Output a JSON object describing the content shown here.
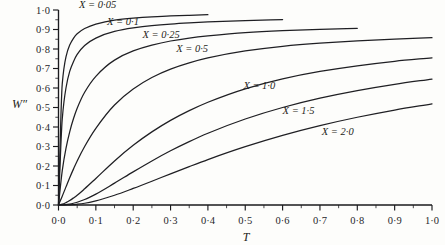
{
  "figure": {
    "background_color": "#fdfdfb",
    "ink_color": "#1f1f23"
  },
  "axes": {
    "y_title": "W″",
    "x_title": "T",
    "y_ticks": [
      "0·0",
      "0·1",
      "0·2",
      "0·3",
      "0·4",
      "0·5",
      "0·6",
      "0·7",
      "0·8",
      "0·9",
      "1·0"
    ],
    "x_ticks": [
      "0·0",
      "0·1",
      "0·2",
      "0·3",
      "0·4",
      "0·5",
      "0·6",
      "0·7",
      "0·8",
      "0·9",
      "1·0"
    ]
  },
  "curve_labels": [
    {
      "text": "X = 0·05"
    },
    {
      "text": "X = 0·1"
    },
    {
      "text": "X = 0·25"
    },
    {
      "text": "X = 0·5"
    },
    {
      "text": "X = 1·0"
    },
    {
      "text": "X = 1·5"
    },
    {
      "text": "X = 2·0"
    }
  ],
  "chart_data": {
    "type": "line",
    "title": "",
    "xlabel": "T",
    "ylabel": "W″",
    "xlim": [
      0.0,
      1.0
    ],
    "ylim": [
      0.0,
      1.0
    ],
    "grid": false,
    "legend": "inline-curve-labels",
    "x_tick_values": [
      0.0,
      0.1,
      0.2,
      0.3,
      0.4,
      0.5,
      0.6,
      0.7,
      0.8,
      0.9,
      1.0
    ],
    "y_tick_values": [
      0.0,
      0.1,
      0.2,
      0.3,
      0.4,
      0.5,
      0.6,
      0.7,
      0.8,
      0.9,
      1.0
    ],
    "x_tick_labels": [
      "0·0",
      "0·1",
      "0·2",
      "0·3",
      "0·4",
      "0·5",
      "0·6",
      "0·7",
      "0·8",
      "0·9",
      "1·0"
    ],
    "y_tick_labels": [
      "0·0",
      "0·1",
      "0·2",
      "0·3",
      "0·4",
      "0·5",
      "0·6",
      "0·7",
      "0·8",
      "0·9",
      "1·0"
    ],
    "x": [
      0.0,
      0.01,
      0.02,
      0.03,
      0.04,
      0.05,
      0.07,
      0.1,
      0.15,
      0.2,
      0.25,
      0.3,
      0.35,
      0.4,
      0.5,
      0.6,
      0.7,
      0.8,
      0.9,
      1.0
    ],
    "series": [
      {
        "name": "X = 0·05",
        "parameter": 0.05,
        "label_position": {
          "x": 0.055,
          "y": 1.01
        },
        "x_end": 0.45,
        "values": [
          0.0,
          0.62,
          0.76,
          0.82,
          0.855,
          0.878,
          0.905,
          0.928,
          0.948,
          0.958,
          0.965,
          0.97,
          0.973,
          0.976,
          null,
          null,
          null,
          null,
          null,
          null
        ]
      },
      {
        "name": "X = 0·1",
        "parameter": 0.1,
        "label_position": {
          "x": 0.13,
          "y": 0.925
        },
        "x_end": 0.66,
        "values": [
          0.0,
          0.44,
          0.6,
          0.685,
          0.735,
          0.772,
          0.818,
          0.856,
          0.89,
          0.908,
          0.92,
          0.928,
          0.934,
          0.939,
          0.946,
          0.951,
          0.954,
          null,
          null,
          null
        ]
      },
      {
        "name": "X = 0·25",
        "parameter": 0.25,
        "label_position": {
          "x": 0.225,
          "y": 0.855
        },
        "x_end": 0.8,
        "values": [
          0.0,
          0.175,
          0.29,
          0.375,
          0.442,
          0.496,
          0.578,
          0.66,
          0.743,
          0.79,
          0.82,
          0.841,
          0.856,
          0.867,
          0.884,
          0.894,
          0.901,
          0.906,
          null,
          null
        ]
      },
      {
        "name": "X = 0·5",
        "parameter": 0.5,
        "label_position": {
          "x": 0.315,
          "y": 0.785
        },
        "x_end": 1.0,
        "values": [
          0.0,
          0.045,
          0.093,
          0.14,
          0.184,
          0.226,
          0.3,
          0.393,
          0.513,
          0.595,
          0.654,
          0.697,
          0.729,
          0.754,
          0.79,
          0.814,
          0.83,
          0.842,
          0.851,
          0.858
        ]
      },
      {
        "name": "X = 1·0",
        "parameter": 1.0,
        "label_position": {
          "x": 0.495,
          "y": 0.595
        },
        "x_end": 1.0,
        "values": [
          0.0,
          0.004,
          0.012,
          0.023,
          0.036,
          0.05,
          0.083,
          0.136,
          0.226,
          0.306,
          0.375,
          0.434,
          0.484,
          0.527,
          0.596,
          0.647,
          0.685,
          0.714,
          0.737,
          0.755
        ]
      },
      {
        "name": "X = 1·5",
        "parameter": 1.5,
        "label_position": {
          "x": 0.6,
          "y": 0.465
        },
        "x_end": 1.0,
        "values": [
          0.0,
          0.0005,
          0.002,
          0.005,
          0.009,
          0.014,
          0.028,
          0.056,
          0.112,
          0.17,
          0.226,
          0.278,
          0.325,
          0.368,
          0.441,
          0.5,
          0.548,
          0.587,
          0.619,
          0.646
        ]
      },
      {
        "name": "X = 2·0",
        "parameter": 2.0,
        "label_position": {
          "x": 0.705,
          "y": 0.36
        },
        "x_end": 1.0,
        "values": [
          0.0,
          0.0001,
          0.0004,
          0.001,
          0.002,
          0.004,
          0.009,
          0.021,
          0.05,
          0.085,
          0.122,
          0.16,
          0.197,
          0.233,
          0.299,
          0.357,
          0.407,
          0.45,
          0.487,
          0.519
        ]
      }
    ]
  }
}
